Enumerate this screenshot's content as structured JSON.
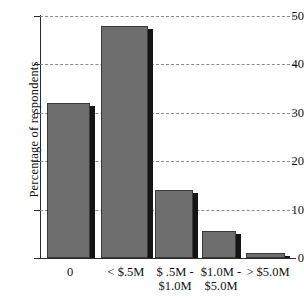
{
  "chart_data": {
    "type": "bar",
    "title": "",
    "subtitle": "",
    "xlabel": "",
    "ylabel": "Percentage of respondents",
    "categories": [
      "0",
      "< $.5M",
      "$ .5M -\n$1.0M",
      "$1.0M -\n$5.0M",
      "> $5.0M"
    ],
    "values": [
      32,
      48,
      14,
      5.5,
      1
    ],
    "ylim": [
      0,
      50
    ],
    "yticks": [
      "0",
      "10",
      "20",
      "30",
      "40",
      "50"
    ],
    "ytick_values": [
      0,
      10,
      20,
      30,
      40,
      50
    ],
    "grid": "horizontal-dashed",
    "legend": "none",
    "bar_color": "#6e6e6e",
    "bar_edge_color": "#3a3a3a",
    "shadow_color": "#141414",
    "grid_color": "#8b8b93",
    "axis_color": "#2b2b2b",
    "background": "#ffffff"
  }
}
